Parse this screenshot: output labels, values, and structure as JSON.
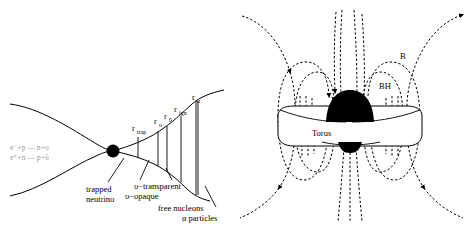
{
  "figure": {
    "background_color": "#ffffff",
    "line_color": "#000000",
    "equation_color": "#9a9a9a"
  },
  "left_panel": {
    "name": "neutrino-driven-outflow-diagram",
    "equations": [
      "e⁻+p — n+υ",
      "e⁺+n — p+ῡ"
    ],
    "center_object": "black-hole-dot",
    "radii": [
      {
        "id": "r-trap",
        "base": "r",
        "sub": "trap",
        "x": 138,
        "y": 131
      },
      {
        "id": "r-nu",
        "base": "r",
        "sub": "υ",
        "x": 158,
        "y": 124
      },
      {
        "id": "r-nubar",
        "base": "r",
        "sub": "ῡ",
        "x": 168,
        "y": 120
      },
      {
        "id": "r-ign",
        "base": "r",
        "sub": "ign",
        "x": 181,
        "y": 113
      },
      {
        "id": "r-alpha",
        "base": "r",
        "sub": "α",
        "x": 198,
        "y": 103
      }
    ],
    "captions": [
      {
        "id": "trapped-neutrino",
        "line1": "trapped",
        "line2": "neutrino"
      },
      {
        "id": "nu-opaque",
        "line1": "υ−opaque",
        "line2": ""
      },
      {
        "id": "nu-transparent",
        "line1": "υ−transparent",
        "line2": ""
      },
      {
        "id": "free-nucleons",
        "line1": "free nucleons",
        "line2": ""
      },
      {
        "id": "alpha-particles",
        "line1": "α particles",
        "line2": ""
      }
    ]
  },
  "right_panel": {
    "name": "black-hole-torus-magnetic-field-diagram",
    "labels": [
      {
        "id": "bh-label",
        "text": "BH",
        "x": 145,
        "y": 86
      },
      {
        "id": "b-label",
        "text": "B",
        "x": 166,
        "y": 56
      },
      {
        "id": "torus-label",
        "text": "Torus",
        "x": 79,
        "y": 133
      }
    ],
    "components": [
      "black-hole",
      "accretion-torus",
      "magnetic-field-lines"
    ]
  }
}
